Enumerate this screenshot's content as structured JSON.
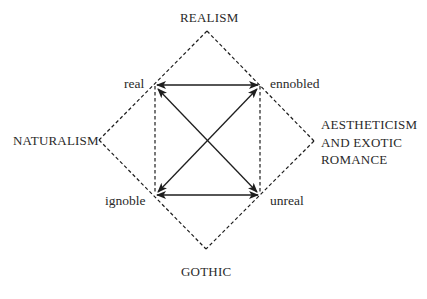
{
  "diagram": {
    "type": "semiotic-square",
    "outer_labels": {
      "top": "REALISM",
      "left": "NATURALISM",
      "right_lines": [
        "AESTHETICISM",
        "AND EXOTIC",
        "ROMANCE"
      ],
      "bottom": "GOTHIC"
    },
    "corner_labels": {
      "top_left": "real",
      "top_right": "ennobled",
      "bottom_left": "ignoble",
      "bottom_right": "unreal"
    },
    "relations": [
      {
        "from": "real",
        "to": "ennobled",
        "style": "solid",
        "arrows": "both"
      },
      {
        "from": "ignoble",
        "to": "unreal",
        "style": "solid",
        "arrows": "both"
      },
      {
        "from": "real",
        "to": "unreal",
        "style": "solid",
        "arrows": "both"
      },
      {
        "from": "ignoble",
        "to": "ennobled",
        "style": "solid",
        "arrows": "both"
      },
      {
        "from": "real",
        "to": "ignoble",
        "style": "dashed",
        "arrows": "none"
      },
      {
        "from": "ennobled",
        "to": "unreal",
        "style": "dashed",
        "arrows": "none"
      }
    ],
    "outer_diamond": {
      "style": "dashed",
      "vertices": [
        "REALISM",
        "AESTHETICISM AND EXOTIC ROMANCE",
        "GOTHIC",
        "NATURALISM"
      ]
    },
    "colors": {
      "line": "#1e1e1e",
      "text": "#2a2a2a",
      "background": "#ffffff"
    }
  }
}
